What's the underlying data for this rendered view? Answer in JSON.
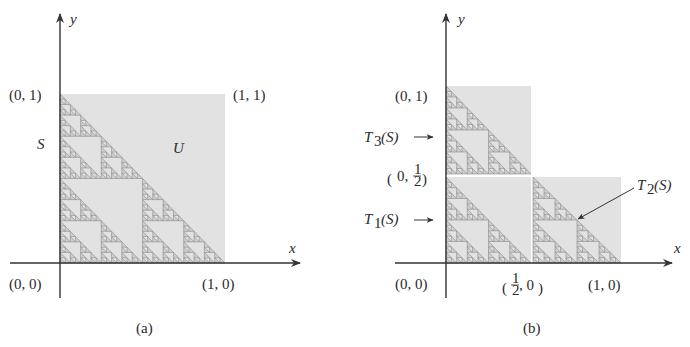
{
  "colors": {
    "background": "#ffffff",
    "square_fill": "#e2e2e2",
    "fractal_stroke": "#8a8a8a",
    "fractal_fill": "#cfcfcf",
    "axis": "#333333",
    "text": "#2a2a2a"
  },
  "fractal_depth": 5,
  "panel_a": {
    "caption": "(a)",
    "axis_x_label": "x",
    "axis_y_label": "y",
    "label_01": "(0, 1)",
    "label_11": "(1, 1)",
    "label_00": "(0, 0)",
    "label_10": "(1, 0)",
    "label_S": "S",
    "label_U": "U"
  },
  "panel_b": {
    "caption": "(b)",
    "axis_x_label": "x",
    "axis_y_label": "y",
    "label_01": "(0, 1)",
    "label_00": "(0, 0)",
    "label_10": "(1, 0)",
    "label_0_half_left": "(",
    "label_0_half_zero": "0,",
    "label_half_num": "1",
    "label_half_den": "2",
    "label_0_half_right": ")",
    "label_half_0_left": "(",
    "label_half_0_zero": ", 0",
    "label_half_0_right": ")",
    "T3_main": "T",
    "T3_sub": "3",
    "T3_arg": "(S)",
    "T1_main": "T",
    "T1_sub": "1",
    "T1_arg": "(S)",
    "T2_main": "T",
    "T2_sub": "2",
    "T2_arg": "(S)"
  }
}
